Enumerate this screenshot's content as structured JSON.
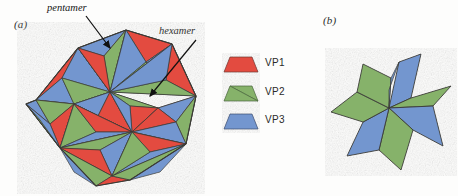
{
  "figure": {
    "panels": [
      {
        "id": "a",
        "label": "(a)",
        "subject": "icosahedral viral capsid",
        "callouts": [
          {
            "name": "pentamer",
            "text": "pentamer",
            "target": "five-fold vertex"
          },
          {
            "name": "hexamer",
            "text": "hexamer",
            "target": "six-fold vertex"
          }
        ]
      },
      {
        "id": "b",
        "label": "(b)",
        "subject": "six-fold pinwheel rosette of alternating subunits"
      }
    ],
    "legend": {
      "items": [
        {
          "label": "VP1",
          "color": "#e34b3f",
          "shape": "trapezoid"
        },
        {
          "label": "VP2",
          "color": "#86b26a",
          "shape": "trapezoid"
        },
        {
          "label": "VP3",
          "color": "#7396cf",
          "shape": "trapezoid"
        }
      ]
    },
    "colors": {
      "vp1_red": "#e34b3f",
      "vp2_green": "#86b26a",
      "vp3_blue": "#7396cf",
      "outline": "#3a3a35",
      "background": "#fdfdfc",
      "arrow": "#111111"
    }
  }
}
